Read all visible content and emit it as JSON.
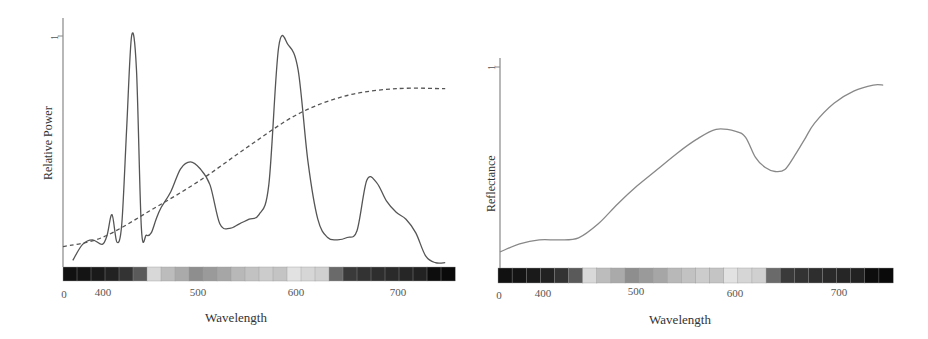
{
  "chart_data": [
    {
      "type": "line",
      "title": "",
      "xlabel": "Wavelength",
      "ylabel": "Relative Power",
      "x_ticks": [
        "0",
        "400",
        "500",
        "600",
        "700"
      ],
      "y_ticks": [
        "1"
      ],
      "xlim": [
        360,
        760
      ],
      "ylim": [
        0,
        1
      ],
      "grid": false,
      "legend": null,
      "series": [
        {
          "name": "Fluorescent illuminant (solid)",
          "style": "solid",
          "x": [
            370,
            380,
            390,
            400,
            405,
            410,
            415,
            420,
            425,
            430,
            435,
            440,
            445,
            450,
            455,
            460,
            470,
            480,
            490,
            500,
            510,
            520,
            530,
            540,
            550,
            560,
            570,
            580,
            590,
            600,
            610,
            620,
            630,
            640,
            650,
            660,
            670,
            680,
            690,
            700,
            710,
            720,
            730,
            740,
            750
          ],
          "values": [
            0.02,
            0.09,
            0.11,
            0.09,
            0.13,
            0.22,
            0.1,
            0.18,
            0.6,
            1.0,
            0.85,
            0.16,
            0.13,
            0.14,
            0.2,
            0.25,
            0.32,
            0.42,
            0.45,
            0.42,
            0.35,
            0.18,
            0.16,
            0.18,
            0.2,
            0.22,
            0.35,
            0.95,
            0.96,
            0.85,
            0.45,
            0.2,
            0.12,
            0.11,
            0.12,
            0.15,
            0.37,
            0.36,
            0.28,
            0.23,
            0.2,
            0.14,
            0.04,
            0.01,
            0.01
          ]
        },
        {
          "name": "Daylight / blackbody (dashed)",
          "style": "dashed",
          "x": [
            360,
            400,
            450,
            500,
            550,
            600,
            650,
            700,
            750
          ],
          "values": [
            0.08,
            0.12,
            0.24,
            0.37,
            0.52,
            0.66,
            0.74,
            0.77,
            0.77
          ]
        }
      ],
      "color_bar": [
        "#111111",
        "#141414",
        "#1a1a1a",
        "#222222",
        "#333333",
        "#5a5a5a",
        "#d8d8d8",
        "#bcbcbc",
        "#aaaaaa",
        "#8e8e8e",
        "#9a9a9a",
        "#a6a6a6",
        "#b8b8b8",
        "#c2c2c2",
        "#cccccc",
        "#c4c4c4",
        "#e2e2e2",
        "#d6d6d6",
        "#d0d0d0",
        "#6a6a6a",
        "#3a3a3a",
        "#333333",
        "#2e2e2e",
        "#2a2a2a",
        "#262626",
        "#222222",
        "#0d0d0d",
        "#0a0a0a"
      ]
    },
    {
      "type": "line",
      "title": "",
      "xlabel": "Wavelength",
      "ylabel": "Reflectance",
      "x_ticks": [
        "0",
        "400",
        "500",
        "600",
        "700"
      ],
      "y_ticks": [
        "1"
      ],
      "xlim": [
        360,
        760
      ],
      "ylim": [
        0,
        1
      ],
      "grid": false,
      "legend": null,
      "series": [
        {
          "name": "Surface reflectance",
          "style": "solid",
          "x": [
            360,
            380,
            400,
            420,
            440,
            460,
            480,
            500,
            520,
            540,
            560,
            580,
            600,
            610,
            620,
            630,
            640,
            650,
            660,
            670,
            680,
            700,
            720,
            740,
            750
          ],
          "values": [
            0.08,
            0.12,
            0.14,
            0.14,
            0.15,
            0.22,
            0.32,
            0.41,
            0.49,
            0.57,
            0.64,
            0.69,
            0.68,
            0.65,
            0.55,
            0.5,
            0.48,
            0.49,
            0.56,
            0.64,
            0.72,
            0.82,
            0.88,
            0.91,
            0.91
          ]
        }
      ],
      "color_bar": [
        "#111111",
        "#141414",
        "#1a1a1a",
        "#222222",
        "#333333",
        "#5a5a5a",
        "#d8d8d8",
        "#bcbcbc",
        "#aaaaaa",
        "#8e8e8e",
        "#9a9a9a",
        "#a6a6a6",
        "#b8b8b8",
        "#c2c2c2",
        "#cccccc",
        "#c4c4c4",
        "#e2e2e2",
        "#d6d6d6",
        "#d0d0d0",
        "#6a6a6a",
        "#3a3a3a",
        "#333333",
        "#2e2e2e",
        "#2a2a2a",
        "#262626",
        "#222222",
        "#0d0d0d",
        "#0a0a0a"
      ]
    }
  ],
  "left": {
    "ylabel": "Relative Power",
    "xlabel": "Wavelength",
    "one": "1",
    "ticks": [
      "0",
      "400",
      "500",
      "600",
      "700"
    ]
  },
  "right": {
    "ylabel": "Reflectance",
    "xlabel": "Wavelength",
    "one": "1",
    "ticks": [
      "0",
      "400",
      "500",
      "600",
      "700"
    ]
  },
  "colors": {
    "axis": "#888888",
    "line": "#555555",
    "curve_right": "#888888"
  }
}
